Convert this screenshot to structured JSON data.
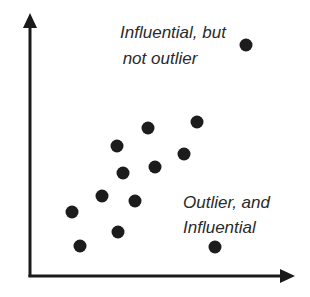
{
  "chart_data": {
    "type": "scatter",
    "title": "",
    "xlabel": "",
    "ylabel": "",
    "grid": false,
    "legend": null,
    "points_px": [
      {
        "x": 148,
        "y": 128
      },
      {
        "x": 197,
        "y": 122
      },
      {
        "x": 117,
        "y": 146
      },
      {
        "x": 184,
        "y": 154
      },
      {
        "x": 123,
        "y": 173
      },
      {
        "x": 155,
        "y": 167
      },
      {
        "x": 102,
        "y": 196
      },
      {
        "x": 135,
        "y": 201
      },
      {
        "x": 72,
        "y": 212
      },
      {
        "x": 118,
        "y": 232
      },
      {
        "x": 80,
        "y": 246
      }
    ],
    "special_points_px": [
      {
        "x": 246,
        "y": 45,
        "label": "Influential, but not outlier"
      },
      {
        "x": 215,
        "y": 247,
        "label": "Outlier, and Influential"
      }
    ],
    "annotations": [
      {
        "lines": [
          "Influential, but",
          "not outlier"
        ]
      },
      {
        "lines": [
          "Outlier, and",
          "Influential"
        ]
      }
    ]
  },
  "labels": {
    "top_line1": "Influential, but",
    "top_line2": "not outlier",
    "bottom_line1": "Outlier, and",
    "bottom_line2": "Influential"
  },
  "colors": {
    "axis": "#1a1a1a",
    "dot": "#1c1c1c",
    "text": "#2a2a2a"
  }
}
